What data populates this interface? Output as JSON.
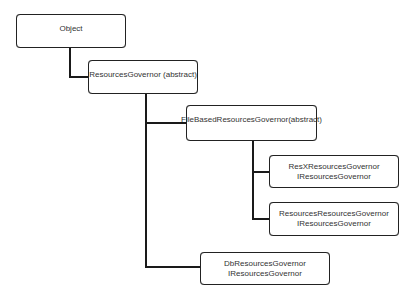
{
  "diagram": {
    "type": "class-hierarchy",
    "nodes": [
      {
        "id": "object",
        "lines": [
          "Object"
        ]
      },
      {
        "id": "resources-governor",
        "lines": [
          "ResourcesGovernor (abstract)"
        ]
      },
      {
        "id": "file-based-resources-governor",
        "lines": [
          "FileBasedResourcesGovernor(abstract)"
        ]
      },
      {
        "id": "resx-resources-governor",
        "lines": [
          "ResXResourcesGovernor",
          "IResourcesGovernor"
        ]
      },
      {
        "id": "resources-resources-governor",
        "lines": [
          "ResourcesResourcesGovernor",
          "IResourcesGovernor"
        ]
      },
      {
        "id": "db-resources-governor",
        "lines": [
          "DbResourcesGovernor",
          "IResourcesGovernor"
        ]
      }
    ],
    "edges": [
      {
        "from": "object",
        "to": "resources-governor"
      },
      {
        "from": "resources-governor",
        "to": "file-based-resources-governor"
      },
      {
        "from": "resources-governor",
        "to": "db-resources-governor"
      },
      {
        "from": "file-based-resources-governor",
        "to": "resx-resources-governor"
      },
      {
        "from": "file-based-resources-governor",
        "to": "resources-resources-governor"
      }
    ],
    "colors": {
      "line": "#1a1a1a",
      "box_border": "#222222",
      "text": "#333333",
      "background": "#ffffff"
    }
  }
}
